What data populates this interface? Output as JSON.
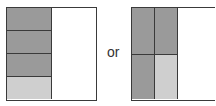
{
  "figure": {
    "connector_text": "or",
    "colors": {
      "dark": "#9a9a9a",
      "light": "#cfcfcf",
      "empty": "#ffffff",
      "line": "#3a3a3a"
    },
    "left_model": {
      "description": "square split into halves; left half divided into 4 rows; 3 dark, 1 light",
      "cells": [
        "dark",
        "dark",
        "dark",
        "light"
      ]
    },
    "right_model": {
      "description": "square split vertically into thirds; left two-thirds divided into 2x2 grid; 3 dark, 1 light",
      "cells": [
        "dark",
        "dark",
        "dark",
        "light"
      ]
    }
  }
}
